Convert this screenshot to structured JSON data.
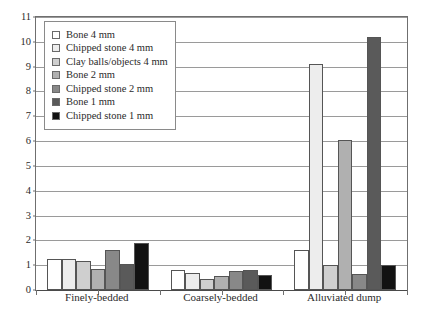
{
  "chart_data": {
    "type": "bar",
    "title": "",
    "subtitle": "",
    "xlabel": "",
    "ylabel": "",
    "ylim": [
      0,
      11
    ],
    "ytick_labels": [
      "0",
      "1",
      "2",
      "3",
      "4",
      "5",
      "6",
      "7",
      "8",
      "9",
      "10",
      "11"
    ],
    "ytick_values": [
      0,
      1,
      2,
      3,
      4,
      5,
      6,
      7,
      8,
      9,
      10,
      11
    ],
    "grid": true,
    "legend_position": "upper-left",
    "categories": [
      "Finely-bedded",
      "Coarsely-bedded",
      "Alluviated dump"
    ],
    "series": [
      {
        "name": "Bone 4 mm",
        "color": "#ffffff",
        "values": [
          1.25,
          0.8,
          1.6
        ]
      },
      {
        "name": "Chipped stone 4 mm",
        "color": "#ededed",
        "values": [
          1.25,
          0.7,
          9.1
        ]
      },
      {
        "name": "Clay balls/objects 4 mm",
        "color": "#cfcfcf",
        "values": [
          1.15,
          0.45,
          1.0
        ]
      },
      {
        "name": "Bone 2 mm",
        "color": "#b0b0b0",
        "values": [
          0.85,
          0.55,
          6.05
        ]
      },
      {
        "name": "Chipped stone 2 mm",
        "color": "#888888",
        "values": [
          1.6,
          0.75,
          0.65
        ]
      },
      {
        "name": "Bone 1 mm",
        "color": "#5a5a5a",
        "values": [
          1.05,
          0.8,
          10.2
        ]
      },
      {
        "name": "Chipped stone 1 mm",
        "color": "#121212",
        "values": [
          1.9,
          0.6,
          1.0
        ]
      }
    ]
  }
}
